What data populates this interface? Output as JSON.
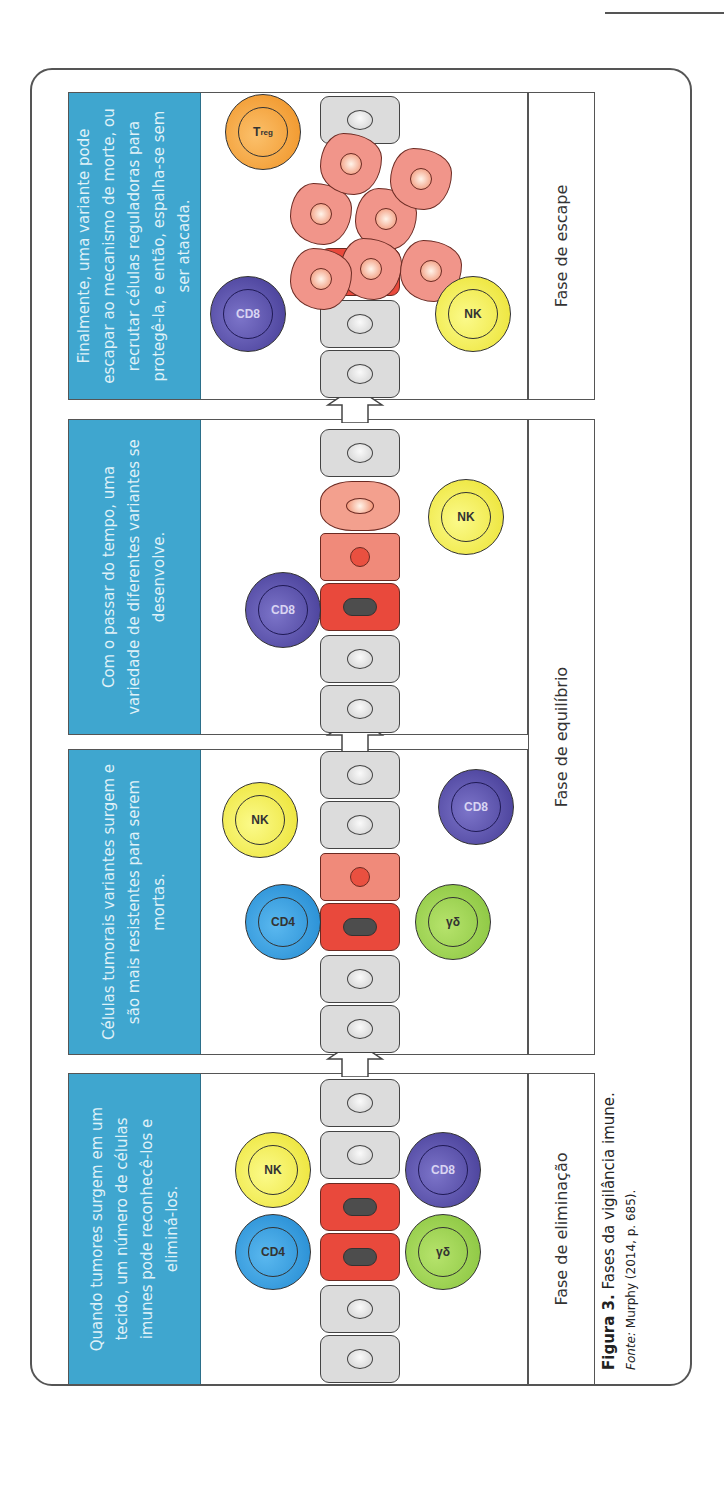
{
  "figure": {
    "number_label": "Figura 3.",
    "title": "Fases da vigilância imune.",
    "source_label": "Fonte:",
    "source_text": "Murphy (2014, p. 685)."
  },
  "panels": [
    {
      "id": "elimination",
      "description": "Quando tumores surgem em um tecido, um número de células imunes pode reconhecê-los e eliminá-los.",
      "immune_cells": [
        "CD4",
        "NK",
        "γδ",
        "CD8"
      ]
    },
    {
      "id": "variants",
      "description": "Células tumorais variantes surgem e são mais resistentes para serem mortas.",
      "immune_cells": [
        "NK",
        "CD4",
        "γδ",
        "CD8"
      ]
    },
    {
      "id": "diversity",
      "description": "Com o passar do tempo, uma variedade de diferentes variantes se desenvolve.",
      "immune_cells": [
        "CD8",
        "NK"
      ]
    },
    {
      "id": "escape",
      "description": "Finalmente, uma variante pode escapar ao mecanismo de morte, ou recrutar células reguladoras para protegê-la, e então, espalha-se sem ser atacada.",
      "immune_cells": [
        "CD8",
        "Treg",
        "NK"
      ]
    }
  ],
  "phases": [
    {
      "label": "Fase de eliminação"
    },
    {
      "label": "Fase de equilíbrio"
    },
    {
      "label": "Fase de escape"
    }
  ],
  "cell_labels": {
    "cd4": "CD4",
    "cd8": "CD8",
    "nk": "NK",
    "gd": "γδ",
    "treg_main": "T",
    "treg_sub": "reg"
  },
  "colors": {
    "header_blue": "#3fa6cf",
    "tumor_red": "#e9493c",
    "variant_pink": "#f08a7a",
    "normal_gray": "#dcdcdc",
    "cd4_blue": "#1e86cf",
    "cd8_purple": "#3f3690",
    "nk_yellow": "#eae02a",
    "gd_green": "#84c13a",
    "treg_orange": "#ef8f1f"
  }
}
